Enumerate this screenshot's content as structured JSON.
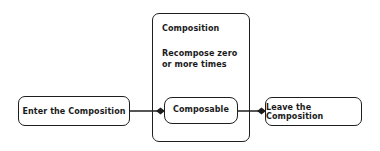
{
  "diagram": {
    "nodes": {
      "enter": {
        "label": "Enter the Composition"
      },
      "composition": {
        "title": "Composition",
        "subtitle": "Recompose zero or more times"
      },
      "composable": {
        "label": "Composable"
      },
      "leave": {
        "label": "Leave the Composition"
      }
    },
    "edges": [
      {
        "from": "enter",
        "to": "composable",
        "arrowhead": "diamond"
      },
      {
        "from": "composable",
        "to": "leave",
        "arrowhead": "diamond"
      }
    ],
    "colors": {
      "stroke": "#1e1e1e",
      "background": "#ffffff"
    }
  }
}
